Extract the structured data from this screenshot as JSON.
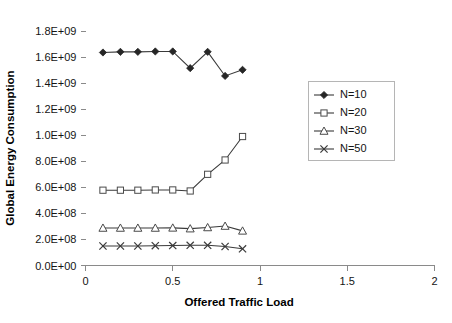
{
  "chart_data": {
    "type": "line",
    "title": "",
    "xlabel": "Offered Traffic Load",
    "ylabel": "Global Energy Consumption",
    "xlim": [
      0,
      2
    ],
    "ylim": [
      0,
      1800000000
    ],
    "grid": false,
    "legend_position": "right",
    "x_ticks": [
      "0",
      "0.5",
      "1",
      "1.5",
      "2"
    ],
    "x_tick_values": [
      0,
      0.5,
      1,
      1.5,
      2
    ],
    "y_ticks": [
      "0.0E+00",
      "2.0E+08",
      "4.0E+08",
      "6.0E+08",
      "8.0E+08",
      "1.0E+09",
      "1.2E+09",
      "1.4E+09",
      "1.6E+09",
      "1.8E+09"
    ],
    "y_tick_values": [
      0,
      200000000,
      400000000,
      600000000,
      800000000,
      1000000000,
      1200000000,
      1400000000,
      1600000000,
      1800000000
    ],
    "x": [
      0.1,
      0.2,
      0.3,
      0.4,
      0.5,
      0.6,
      0.7,
      0.8,
      0.9
    ],
    "series": [
      {
        "name": "N=10",
        "marker": "filled-diamond",
        "color": "#262626",
        "values": [
          1635000000,
          1640000000,
          1640000000,
          1643000000,
          1643000000,
          1515000000,
          1640000000,
          1455000000,
          1502000000
        ]
      },
      {
        "name": "N=20",
        "marker": "open-square",
        "color": "#4a4a4a",
        "values": [
          578000000,
          578000000,
          578000000,
          580000000,
          580000000,
          572000000,
          700000000,
          810000000,
          990000000
        ]
      },
      {
        "name": "N=30",
        "marker": "open-triangle",
        "color": "#4a4a4a",
        "values": [
          288000000,
          288000000,
          288000000,
          288000000,
          289000000,
          283000000,
          292000000,
          303000000,
          266000000
        ]
      },
      {
        "name": "N=50",
        "marker": "cross",
        "color": "#3a3a3a",
        "values": [
          150000000,
          150000000,
          150000000,
          152000000,
          153000000,
          155000000,
          155000000,
          146000000,
          128000000
        ]
      }
    ]
  },
  "legend": {
    "entries": [
      {
        "label": "N=10"
      },
      {
        "label": "N=20"
      },
      {
        "label": "N=30"
      },
      {
        "label": "N=50"
      }
    ]
  },
  "axes": {
    "x_title": "Offered Traffic Load",
    "y_title": "Global Energy Consumption"
  }
}
